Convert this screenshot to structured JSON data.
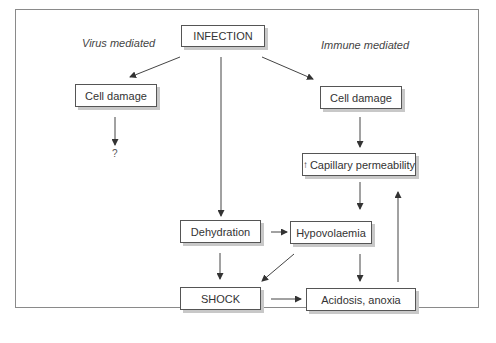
{
  "diagram": {
    "labels": {
      "left": "Virus mediated",
      "right": "Immune mediated",
      "unknown": "?"
    },
    "nodes": {
      "infection": "INFECTION",
      "cell_damage_left": "Cell damage",
      "cell_damage_right": "Cell damage",
      "capillary_arrow": "↑",
      "capillary": "Capillary permeability",
      "dehydration": "Dehydration",
      "hypovolaemia": "Hypovolaemia",
      "shock": "SHOCK",
      "acidosis": "Acidosis, anoxia"
    },
    "edges": [
      [
        "INFECTION",
        "Cell damage (virus)"
      ],
      [
        "INFECTION",
        "Cell damage (immune)"
      ],
      [
        "INFECTION",
        "Dehydration"
      ],
      [
        "Cell damage (virus)",
        "?"
      ],
      [
        "Cell damage (immune)",
        "Capillary permeability"
      ],
      [
        "Capillary permeability",
        "Hypovolaemia"
      ],
      [
        "Dehydration",
        "Hypovolaemia"
      ],
      [
        "Dehydration",
        "SHOCK"
      ],
      [
        "Hypovolaemia",
        "SHOCK"
      ],
      [
        "Hypovolaemia",
        "Acidosis, anoxia"
      ],
      [
        "SHOCK",
        "Acidosis, anoxia"
      ],
      [
        "Acidosis, anoxia",
        "Capillary permeability"
      ]
    ]
  }
}
